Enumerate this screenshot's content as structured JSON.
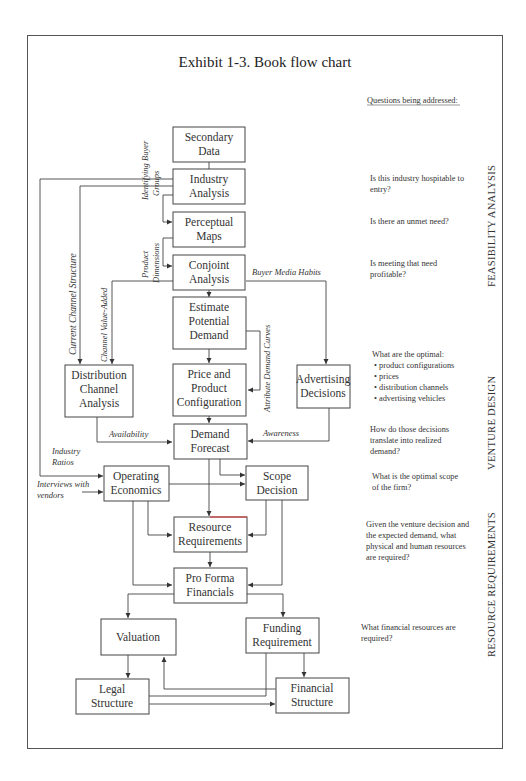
{
  "title": "Exhibit 1-3.  Book flow chart",
  "questions_header": "Questions being addressed:",
  "boxes": {
    "secondary_data": [
      "Secondary",
      "Data"
    ],
    "industry_analysis": [
      "Industry",
      "Analysis"
    ],
    "perceptual_maps": [
      "Perceptual",
      "Maps"
    ],
    "conjoint_analysis": [
      "Conjoint",
      "Analysis"
    ],
    "estimate_potential_demand": [
      "Estimate",
      "Potential",
      "Demand"
    ],
    "distribution_channel_analysis": [
      "Distribution",
      "Channel",
      "Analysis"
    ],
    "price_product_configuration": [
      "Price and",
      "Product",
      "Configuration"
    ],
    "advertising_decisions": [
      "Advertising",
      "Decisions"
    ],
    "demand_forecast": [
      "Demand",
      "Forecast"
    ],
    "operating_economics": [
      "Operating",
      "Economics"
    ],
    "scope_decision": [
      "Scope",
      "Decision"
    ],
    "resource_requirements": [
      "Resource",
      "Requirements"
    ],
    "pro_forma_financials": [
      "Pro Forma",
      "Financials"
    ],
    "valuation": [
      "Valuation"
    ],
    "funding_requirement": [
      "Funding",
      "Requirement"
    ],
    "legal_structure": [
      "Legal",
      "Structure"
    ],
    "financial_structure": [
      "Financial",
      "Structure"
    ]
  },
  "edge_labels": {
    "identifying_buyer_groups": [
      "Identifying Buyer",
      "Groups"
    ],
    "product_dimensions": [
      "Product",
      "Dimensions"
    ],
    "current_channel_structure": "Current Channel Structure",
    "channel_value_added": "Channel Value-Added",
    "buyer_media_habits": "Buyer Media Habits",
    "attribute_demand_curves": "Attribute Demand Curves",
    "availability": "Availability",
    "awareness": "Awareness",
    "industry_ratios": [
      "Industry",
      "Ratios"
    ],
    "interviews_with_vendors": [
      "Interviews with",
      "vendors"
    ]
  },
  "questions": {
    "q1": [
      "Is this industry hospitable to",
      "entry?"
    ],
    "q2": [
      "Is there an unmet need?"
    ],
    "q3": [
      "Is meeting that need",
      "profitable?"
    ],
    "q4_intro": "What are the optimal:",
    "q4_items": [
      "product configurations",
      "prices",
      "distribution channels",
      "advertising vehicles"
    ],
    "q5": [
      "How do those decisions",
      "translate into realized",
      "demand?"
    ],
    "q6": [
      "What is the optimal scope",
      "of the firm?"
    ],
    "q7": [
      "Given the venture decision and",
      "the expected demand, what",
      "physical and human resources",
      "are required?"
    ],
    "q8": [
      "What financial resources are",
      "required?"
    ]
  },
  "sections": {
    "feasibility": "FEASIBILITY ANALYSIS",
    "venture_design": "VENTURE DESIGN",
    "resource_requirements": "RESOURCE REQUIREMENTS"
  },
  "bullet": "•"
}
